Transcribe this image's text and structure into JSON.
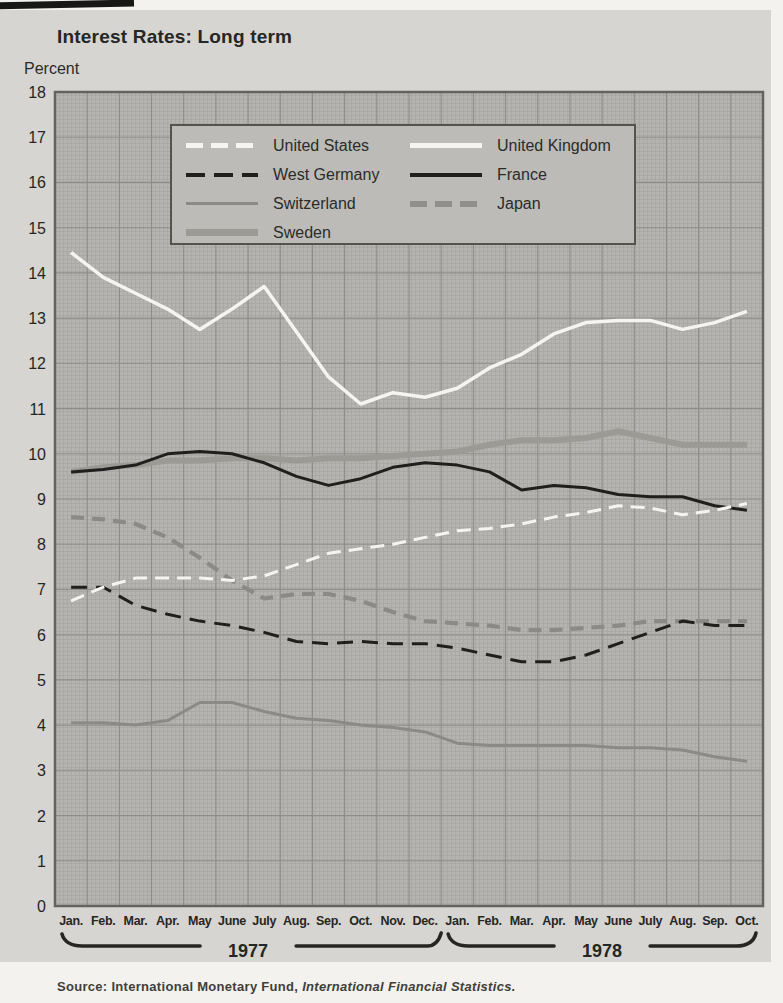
{
  "page": {
    "title": "Interest Rates: Long term",
    "y_axis_unit": "Percent",
    "source_prefix": "Source: International Monetary Fund, ",
    "source_publication": "International Financial Statistics."
  },
  "legend": {
    "items": [
      {
        "label": "United States",
        "style": "us"
      },
      {
        "label": "United Kingdom",
        "style": "uk"
      },
      {
        "label": "West Germany",
        "style": "wg"
      },
      {
        "label": "France",
        "style": "fr"
      },
      {
        "label": "Switzerland",
        "style": "ch"
      },
      {
        "label": "Japan",
        "style": "jp"
      },
      {
        "label": "Sweden",
        "style": "se"
      }
    ]
  },
  "chart_data": {
    "type": "line",
    "title": "Interest Rates: Long term",
    "ylabel": "Percent",
    "ylim": [
      0,
      18
    ],
    "y_tick_step": 1,
    "y_tick_labels": [
      "18",
      "17",
      "16",
      "15",
      "14",
      "13",
      "12",
      "11",
      "10",
      "9",
      "8",
      "7",
      "6",
      "5",
      "4",
      "3",
      "2",
      "1",
      "0"
    ],
    "grid": true,
    "legend_position": "top-inside",
    "x_categories": [
      "Jan.",
      "Feb.",
      "Mar.",
      "Apr.",
      "May",
      "June",
      "July",
      "Aug.",
      "Sep.",
      "Oct.",
      "Nov.",
      "Dec.",
      "Jan.",
      "Feb.",
      "Mar.",
      "Apr.",
      "May",
      "June",
      "July",
      "Aug.",
      "Sep.",
      "Oct."
    ],
    "year_groups": [
      {
        "label": "1977",
        "months": 12
      },
      {
        "label": "1978",
        "months": 10
      }
    ],
    "series": [
      {
        "name": "Sweden",
        "style": "se",
        "values": [
          9.6,
          9.7,
          9.75,
          9.85,
          9.85,
          9.9,
          9.9,
          9.85,
          9.9,
          9.9,
          9.95,
          10.0,
          10.05,
          10.2,
          10.3,
          10.3,
          10.35,
          10.5,
          10.35,
          10.2,
          10.2,
          10.2
        ]
      },
      {
        "name": "Switzerland",
        "style": "ch",
        "values": [
          4.05,
          4.05,
          4.0,
          4.1,
          4.5,
          4.5,
          4.3,
          4.15,
          4.1,
          4.0,
          3.95,
          3.85,
          3.6,
          3.55,
          3.55,
          3.55,
          3.55,
          3.5,
          3.5,
          3.45,
          3.3,
          3.2
        ]
      },
      {
        "name": "Japan",
        "style": "jp",
        "values": [
          8.6,
          8.55,
          8.45,
          8.15,
          7.7,
          7.2,
          6.8,
          6.9,
          6.9,
          6.75,
          6.5,
          6.3,
          6.25,
          6.2,
          6.1,
          6.1,
          6.15,
          6.2,
          6.3,
          6.3,
          6.3,
          6.3
        ]
      },
      {
        "name": "France",
        "style": "fr",
        "values": [
          9.6,
          9.65,
          9.75,
          10.0,
          10.05,
          10.0,
          9.8,
          9.5,
          9.3,
          9.45,
          9.7,
          9.8,
          9.75,
          9.6,
          9.2,
          9.3,
          9.25,
          9.1,
          9.05,
          9.05,
          8.85,
          8.75
        ]
      },
      {
        "name": "West Germany",
        "style": "wg",
        "values": [
          7.05,
          7.05,
          6.65,
          6.45,
          6.3,
          6.2,
          6.05,
          5.85,
          5.8,
          5.85,
          5.8,
          5.8,
          5.7,
          5.55,
          5.4,
          5.4,
          5.55,
          5.8,
          6.05,
          6.3,
          6.2,
          6.2
        ]
      },
      {
        "name": "United Kingdom",
        "style": "uk",
        "values": [
          14.45,
          13.9,
          13.55,
          13.2,
          12.75,
          13.2,
          13.7,
          12.7,
          11.7,
          11.1,
          11.35,
          11.25,
          11.45,
          11.9,
          12.2,
          12.65,
          12.9,
          12.95,
          12.95,
          12.75,
          12.9,
          13.15
        ]
      },
      {
        "name": "United States",
        "style": "us",
        "values": [
          6.75,
          7.05,
          7.25,
          7.25,
          7.25,
          7.2,
          7.3,
          7.55,
          7.8,
          7.9,
          8.0,
          8.15,
          8.3,
          8.35,
          8.45,
          8.6,
          8.7,
          8.85,
          8.8,
          8.65,
          8.75,
          8.9
        ]
      }
    ]
  },
  "colors": {
    "page_bg": "#f3f2ee",
    "panel_bg": "#d6d5d1",
    "plot_bg": "#b5b4b0",
    "grid_fine": "#a7a6a2",
    "grid_major": "#8e8d89",
    "plot_border": "#63635f",
    "line_black": "#1f1f1d",
    "line_white": "#f5f4f0",
    "line_gray": "#8b8a86",
    "line_sweden": "#9b9a94",
    "text_dark": "#262624"
  }
}
